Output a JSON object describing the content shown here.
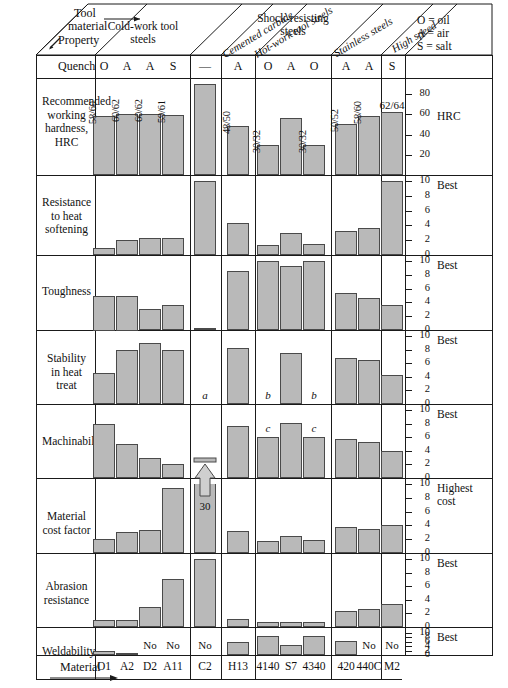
{
  "header": {
    "corner_property": "Property",
    "corner_tool": "Tool",
    "corner_material": "material",
    "quench_label": "Quench",
    "material_label": "Material",
    "legend": [
      "O = oil",
      "A = air",
      "S = salt"
    ],
    "groups": [
      {
        "name": "Cold-work tool steels",
        "style": "straight"
      },
      {
        "name": "Cemented carbide",
        "style": "diagonal"
      },
      {
        "name": "Hot-work tool steels",
        "style": "diagonal"
      },
      {
        "name": "Shock-resisting steels",
        "style": "straight"
      },
      {
        "name": "Stainless steels",
        "style": "diagonal"
      },
      {
        "name": "High speed",
        "style": "diagonal"
      }
    ]
  },
  "columns": [
    {
      "material": "O1",
      "quench": "O",
      "group": 0
    },
    {
      "material": "A2",
      "quench": "A",
      "group": 0
    },
    {
      "material": "D2",
      "quench": "A",
      "group": 0
    },
    {
      "material": "A11",
      "quench": "S",
      "group": 0
    },
    {
      "material": "C2",
      "quench": "—",
      "group": 1
    },
    {
      "material": "H13",
      "quench": "A",
      "group": 2
    },
    {
      "material": "4140",
      "quench": "O",
      "group": 3
    },
    {
      "material": "S7",
      "quench": "A",
      "group": 3
    },
    {
      "material": "4340",
      "quench": "O",
      "group": 3
    },
    {
      "material": "420",
      "quench": "A",
      "group": 4
    },
    {
      "material": "440C",
      "quench": "A",
      "group": 4
    },
    {
      "material": "M2",
      "quench": "S",
      "group": 5
    }
  ],
  "chart_data": {
    "type": "bar",
    "xlabel": "Material",
    "categories": [
      "O1",
      "A2",
      "D2",
      "A11",
      "C2",
      "H13",
      "4140",
      "S7",
      "4340",
      "420",
      "440C",
      "M2"
    ],
    "legend_position": "top-right",
    "grid": false,
    "panels": [
      {
        "name": "Recommended working hardness, HRC",
        "ylabel": "HRC",
        "scale_caption": "HRC",
        "ylim": [
          0,
          90
        ],
        "ticks": [
          20,
          40,
          60,
          80
        ],
        "values": [
          58,
          60,
          60,
          59,
          90,
          48,
          30,
          56,
          30,
          50,
          58,
          62
        ],
        "data_labels": [
          "58/60",
          "60/62",
          "60/62",
          "59/61",
          "",
          "48/50",
          "30/32",
          "56",
          "30/32",
          "50/52",
          "58/60",
          "62/64"
        ],
        "notes": []
      },
      {
        "name": "Resistance to heat softening",
        "scale_caption": "Best",
        "ylim": [
          0,
          10
        ],
        "ticks": [
          0,
          2,
          4,
          6,
          8,
          10
        ],
        "values": [
          1,
          2,
          2.3,
          2.3,
          10,
          4.3,
          1.3,
          3,
          1.5,
          3.3,
          3.6,
          10
        ],
        "data_labels": [
          "",
          "",
          "",
          "",
          "",
          "",
          "",
          "",
          "",
          "",
          "",
          ""
        ],
        "notes": []
      },
      {
        "name": "Toughness",
        "scale_caption": "Best",
        "ylim": [
          0,
          10
        ],
        "ticks": [
          0,
          2,
          4,
          6,
          8,
          10
        ],
        "values": [
          5,
          5,
          3,
          3.6,
          0.3,
          8.6,
          10,
          9.3,
          10,
          5.3,
          4.6,
          3.6
        ],
        "data_labels": [
          "",
          "",
          "",
          "",
          "",
          "",
          "",
          "",
          "",
          "",
          "",
          ""
        ],
        "notes": []
      },
      {
        "name": "Stability in heat treat",
        "scale_caption": "Best",
        "ylim": [
          0,
          10
        ],
        "ticks": [
          0,
          2,
          4,
          6,
          8,
          10
        ],
        "values": [
          4.6,
          8,
          9,
          8,
          0,
          8.3,
          0,
          7.5,
          0,
          6.8,
          6.4,
          4.3
        ],
        "data_labels": [
          "",
          "",
          "",
          "",
          "",
          "",
          "",
          "",
          "",
          "",
          "",
          ""
        ],
        "notes": [
          {
            "col": 4,
            "mark": "a"
          },
          {
            "col": 6,
            "mark": "b"
          },
          {
            "col": 8,
            "mark": "b"
          }
        ]
      },
      {
        "name": "Machinability",
        "scale_caption": "Best",
        "ylim": [
          0,
          10
        ],
        "ticks": [
          0,
          2,
          4,
          6,
          8,
          10
        ],
        "values": [
          8,
          5,
          3,
          2,
          0,
          7.6,
          6,
          8.1,
          6,
          5.8,
          5.3,
          4
        ],
        "data_labels": [
          "",
          "",
          "",
          "",
          "",
          "",
          "",
          "",
          "",
          "",
          "",
          ""
        ],
        "notes": [
          {
            "col": 6,
            "mark": "c"
          },
          {
            "col": 8,
            "mark": "c"
          }
        ]
      },
      {
        "name": "Material cost factor",
        "scale_caption": "Highest cost",
        "ylim": [
          0,
          10
        ],
        "ticks": [
          0,
          2,
          4,
          6,
          8,
          10
        ],
        "values": [
          2,
          3,
          3.4,
          9.4,
          10,
          3.2,
          1.8,
          2.4,
          1.9,
          3.8,
          3.5,
          4
        ],
        "data_labels": [
          "",
          "",
          "",
          "",
          "30",
          "",
          "",
          "",
          "",
          "",
          "",
          ""
        ],
        "broken_bar": {
          "col": 4,
          "value_label": "30",
          "arrow": true
        },
        "notes": []
      },
      {
        "name": "Abrasion resistance",
        "scale_caption": "Best",
        "ylim": [
          0,
          10
        ],
        "ticks": [
          0,
          2,
          4,
          6,
          8,
          10
        ],
        "values": [
          1,
          1,
          3,
          7,
          10,
          1.2,
          0.7,
          0.7,
          0.8,
          2.3,
          2.6,
          3.4
        ],
        "data_labels": [
          "",
          "",
          "",
          "",
          "",
          "",
          "",
          "",
          "",
          "",
          "",
          ""
        ],
        "notes": []
      },
      {
        "name": "Weldability",
        "scale_caption": "Best",
        "ylim": [
          0,
          10
        ],
        "ticks": [
          0,
          2,
          4,
          6,
          8,
          10
        ],
        "values": [
          1.6,
          0.9,
          0,
          0,
          0,
          6,
          8.5,
          4.4,
          8.6,
          6.3,
          0,
          0
        ],
        "data_labels": [
          "",
          "",
          "No",
          "No",
          "No",
          "",
          "",
          "",
          "",
          "",
          "No",
          "No"
        ],
        "notes": []
      }
    ]
  }
}
